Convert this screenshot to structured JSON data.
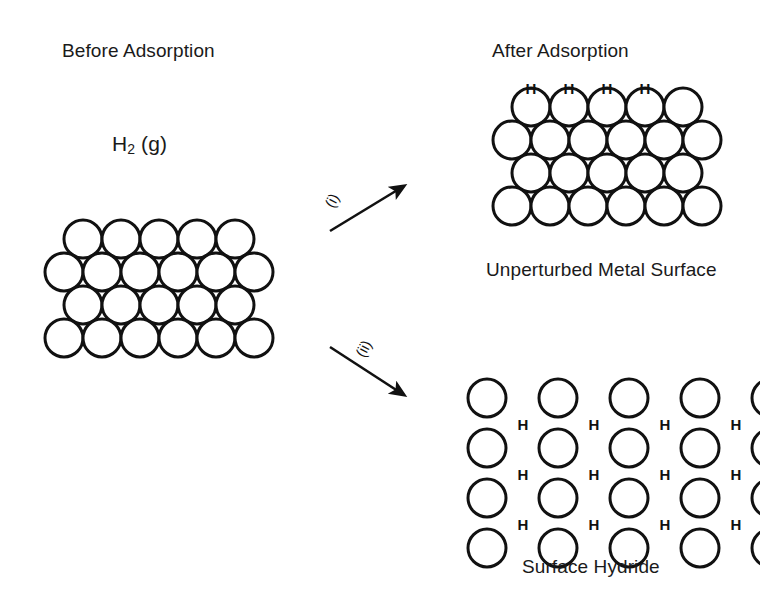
{
  "figure": {
    "title_left": "Before Adsorption",
    "title_right": "After Adsorption",
    "gas_label_text": "H",
    "gas_label_sub": "2",
    "gas_label_state": "(g)",
    "caption_top_right": "Unperturbed Metal Surface",
    "caption_bottom_right": "Surface Hydride",
    "stroke_color": "#111111",
    "fill_color": "#ffffff",
    "text_color": "#1a1a1a"
  },
  "steps": [
    {
      "id": "i",
      "label": "(i)",
      "direction": "up-right",
      "leads_to": "Unperturbed Metal Surface"
    },
    {
      "id": "ii",
      "label": "(ii)",
      "direction": "down-right",
      "leads_to": "Surface Hydride"
    }
  ],
  "lattices": {
    "before": {
      "name": "clean-metal-surface",
      "packing": "close-packed",
      "rows": [
        5,
        6,
        5,
        6
      ],
      "circle_radius": 19,
      "row_spacing": 33,
      "origin_x": 64,
      "origin_y": 239,
      "adsorbed_hydrogens": 0
    },
    "unperturbed": {
      "name": "unperturbed-metal-surface",
      "packing": "close-packed",
      "rows": [
        5,
        6,
        5,
        6
      ],
      "circle_radius": 19,
      "row_spacing": 33,
      "origin_x": 512,
      "origin_y": 107,
      "adsorbed_hydrogens": 4,
      "hydrogen_positions": [
        {
          "x": 531,
          "y": 88
        },
        {
          "x": 569,
          "y": 88
        },
        {
          "x": 607,
          "y": 88
        },
        {
          "x": 645,
          "y": 88
        }
      ]
    },
    "hydride": {
      "name": "surface-hydride",
      "packing": "expanded-square",
      "rows": [
        5,
        5,
        5,
        5
      ],
      "circle_radius": 19,
      "row_spacing": 50,
      "col_spacing": 71,
      "origin_x": 487,
      "origin_y": 398,
      "adsorbed_hydrogens": 12,
      "hydrogen_positions": [
        {
          "x": 523,
          "y": 424
        },
        {
          "x": 594,
          "y": 424
        },
        {
          "x": 665,
          "y": 424
        },
        {
          "x": 736,
          "y": 424
        },
        {
          "x": 523,
          "y": 474
        },
        {
          "x": 594,
          "y": 474
        },
        {
          "x": 665,
          "y": 474
        },
        {
          "x": 736,
          "y": 474
        },
        {
          "x": 523,
          "y": 524
        },
        {
          "x": 594,
          "y": 524
        },
        {
          "x": 665,
          "y": 524
        },
        {
          "x": 736,
          "y": 524
        }
      ],
      "hydrogen_symbol": "H"
    }
  }
}
